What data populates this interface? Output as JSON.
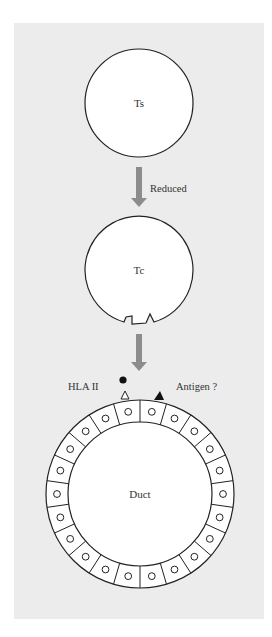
{
  "colors": {
    "panel_bg": "#ececec",
    "cell_fill": "#ffffff",
    "stroke": "#222222",
    "arrow": "#8c8c8c"
  },
  "nodes": {
    "ts": {
      "label": "Ts"
    },
    "tc": {
      "label": "Tc"
    },
    "duct": {
      "label": "Duct",
      "epithelial_cell_count": 22
    }
  },
  "arrows": [
    {
      "from": "Ts",
      "to": "Tc",
      "label": "Reduced"
    },
    {
      "from": "Tc",
      "to": "Duct",
      "label": ""
    }
  ],
  "markers": {
    "hla": {
      "label": "HLA II",
      "shape": "open-triangle"
    },
    "antigen": {
      "label": "Antigen ?",
      "shape": "filled-triangle"
    },
    "dot": {
      "shape": "filled-circle"
    }
  }
}
